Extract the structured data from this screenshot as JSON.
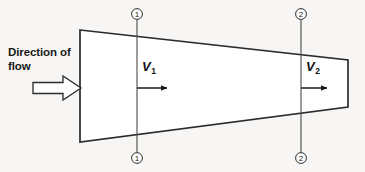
{
  "figure": {
    "kind": "converging-duct-flow-diagram",
    "background_color": "#f7f6f4",
    "line_color": "#262626"
  },
  "annotations": {
    "flow_label_line1": "Direction of",
    "flow_label_line2": "flow",
    "velocity_1": "V",
    "velocity_1_sub": "1",
    "velocity_2": "V",
    "velocity_2_sub": "2"
  },
  "section_markers": [
    {
      "id": "section-1-top",
      "label": "1",
      "x": 137,
      "y": 14
    },
    {
      "id": "section-1-bottom",
      "label": "1",
      "x": 137,
      "y": 158
    },
    {
      "id": "section-2-top",
      "label": "2",
      "x": 301,
      "y": 14
    },
    {
      "id": "section-2-bottom",
      "label": "2",
      "x": 301,
      "y": 158
    }
  ],
  "geometry": {
    "duct_outline": "80,30 348,60 348,107 80,142",
    "inlet_wall": {
      "x": 80,
      "y1": 30,
      "y2": 142
    },
    "outlet_wall": {
      "x": 348,
      "y1": 60,
      "y2": 107
    },
    "section_line_1": {
      "x": 137,
      "y1": 20,
      "y2": 152
    },
    "section_line_2": {
      "x": 301,
      "y1": 20,
      "y2": 152
    },
    "velocity_arrow_1": {
      "x1": 137,
      "x2": 172,
      "y": 88
    },
    "velocity_arrow_2": {
      "x1": 301,
      "x2": 332,
      "y": 88
    },
    "block_arrow": {
      "x1": 33,
      "x2": 80,
      "y": 88
    }
  }
}
